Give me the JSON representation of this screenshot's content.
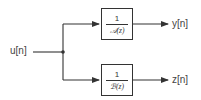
{
  "diagram": {
    "type": "block-diagram",
    "input": {
      "label": "u[n]"
    },
    "blocks": [
      {
        "id": "A",
        "numerator": "1",
        "denominator": "𝒜(z)"
      },
      {
        "id": "B",
        "numerator": "1",
        "denominator": "ℬ(z)"
      }
    ],
    "outputs": [
      {
        "label": "y[n]"
      },
      {
        "label": "z[n]"
      }
    ],
    "edges": [
      {
        "from": "u[n]",
        "to": "junction"
      },
      {
        "from": "junction",
        "to": "A"
      },
      {
        "from": "junction",
        "to": "B"
      },
      {
        "from": "A",
        "to": "y[n]"
      },
      {
        "from": "B",
        "to": "z[n]"
      }
    ],
    "line_color": "#333333"
  }
}
